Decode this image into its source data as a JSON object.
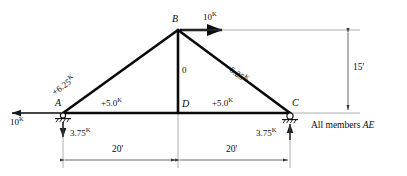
{
  "figure": {
    "type": "truss-free-body-diagram",
    "note": "All members AE",
    "note_italic_part": "AE"
  },
  "nodes": [
    {
      "id": "A",
      "label": "A",
      "x": 63,
      "y": 113,
      "support": "pin"
    },
    {
      "id": "B",
      "label": "B",
      "x": 178,
      "y": 30,
      "support": "none"
    },
    {
      "id": "C",
      "label": "C",
      "x": 290,
      "y": 113,
      "support": "roller"
    },
    {
      "id": "D",
      "label": "D",
      "x": 178,
      "y": 113,
      "support": "none"
    }
  ],
  "members": [
    {
      "id": "AB",
      "from": "A",
      "to": "B",
      "force_label": "+6.25",
      "unit": "K",
      "orientation": "diagonal-left"
    },
    {
      "id": "BC",
      "from": "B",
      "to": "C",
      "force_label": "–6.25",
      "unit": "K",
      "orientation": "diagonal-right"
    },
    {
      "id": "AD",
      "from": "A",
      "to": "D",
      "force_label": "+5.0",
      "unit": "K",
      "orientation": "horizontal"
    },
    {
      "id": "DC",
      "from": "D",
      "to": "C",
      "force_label": "+5.0",
      "unit": "K",
      "orientation": "horizontal"
    },
    {
      "id": "BD",
      "from": "B",
      "to": "D",
      "force_label": "0",
      "unit": "",
      "orientation": "vertical"
    }
  ],
  "loads": [
    {
      "id": "applied-load-B",
      "at": "B",
      "magnitude": "10",
      "unit": "K",
      "direction": "right"
    }
  ],
  "reactions": [
    {
      "id": "reaction-A-horizontal",
      "at": "A",
      "magnitude": "10",
      "unit": "K",
      "direction": "left"
    },
    {
      "id": "reaction-A-vertical",
      "at": "A",
      "magnitude": "3.75",
      "unit": "K",
      "direction": "down"
    },
    {
      "id": "reaction-C-vertical",
      "at": "C",
      "magnitude": "3.75",
      "unit": "K",
      "direction": "up"
    }
  ],
  "dimensions": [
    {
      "id": "span-left",
      "value": "20'",
      "orientation": "horizontal"
    },
    {
      "id": "span-right",
      "value": "20'",
      "orientation": "horizontal"
    },
    {
      "id": "height",
      "value": "15'",
      "orientation": "vertical"
    }
  ],
  "colors": {
    "member": "#0a0a0a",
    "dimension": "#4a4a4a",
    "text": "#0a0a0a",
    "background": "#ffffff"
  }
}
